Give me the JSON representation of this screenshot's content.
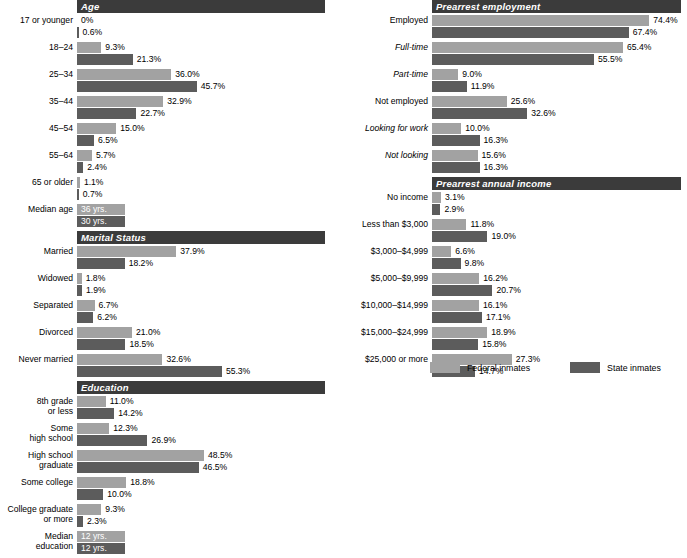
{
  "chart_data": {
    "type": "bar",
    "title": "",
    "orientation": "horizontal",
    "legend": {
      "position": "bottom-right",
      "entries": [
        {
          "name": "Federal inmates",
          "color": "#a2a2a2"
        },
        {
          "name": "State inmates",
          "color": "#5c5c5c"
        }
      ]
    },
    "series_names": [
      "Federal inmates",
      "State inmates"
    ],
    "axis": {
      "unit": "percent",
      "xlim": [
        0,
        80
      ],
      "grid": false,
      "tick_labels_shown": false
    },
    "value_labels": true,
    "sections": [
      {
        "id": "age",
        "title": "Age",
        "categories": [
          "17 or younger",
          "18–24",
          "25–34",
          "35–44",
          "45–54",
          "55–64",
          "65 or older",
          "Median age"
        ],
        "series": [
          {
            "name": "Federal inmates",
            "values": [
              0,
              9.3,
              36.0,
              32.9,
              15.0,
              5.7,
              1.1,
              36
            ]
          },
          {
            "name": "State inmates",
            "values": [
              0.6,
              21.3,
              45.7,
              22.7,
              6.5,
              2.4,
              0.7,
              30
            ]
          }
        ],
        "labels": [
          {
            "fed": "0%",
            "state": "0.6%"
          },
          {
            "fed": "9.3%",
            "state": "21.3%"
          },
          {
            "fed": "36.0%",
            "state": "45.7%"
          },
          {
            "fed": "32.9%",
            "state": "22.7%"
          },
          {
            "fed": "15.0%",
            "state": "6.5%"
          },
          {
            "fed": "5.7%",
            "state": "2.4%"
          },
          {
            "fed": "1.1%",
            "state": "0.7%"
          },
          {
            "fed": "36 yrs.",
            "state": "30 yrs."
          }
        ]
      },
      {
        "id": "marital-status",
        "title": "Marital Status",
        "categories": [
          "Married",
          "Widowed",
          "Separated",
          "Divorced",
          "Never married"
        ],
        "series": [
          {
            "name": "Federal inmates",
            "values": [
              37.9,
              1.8,
              6.7,
              21.0,
              32.6
            ]
          },
          {
            "name": "State inmates",
            "values": [
              18.2,
              1.9,
              6.2,
              18.5,
              55.3
            ]
          }
        ],
        "labels": [
          {
            "fed": "37.9%",
            "state": "18.2%"
          },
          {
            "fed": "1.8%",
            "state": "1.9%"
          },
          {
            "fed": "6.7%",
            "state": "6.2%"
          },
          {
            "fed": "21.0%",
            "state": "18.5%"
          },
          {
            "fed": "32.6%",
            "state": "55.3%"
          }
        ]
      },
      {
        "id": "education",
        "title": "Education",
        "categories": [
          "8th grade\nor less",
          "Some\nhigh school",
          "High school\ngraduate",
          "Some college",
          "College graduate\nor more",
          "Median\neducation"
        ],
        "series": [
          {
            "name": "Federal inmates",
            "values": [
              11.0,
              12.3,
              48.5,
              18.8,
              9.3,
              12
            ]
          },
          {
            "name": "State inmates",
            "values": [
              14.2,
              26.9,
              46.5,
              10.0,
              2.3,
              12
            ]
          }
        ],
        "labels": [
          {
            "fed": "11.0%",
            "state": "14.2%"
          },
          {
            "fed": "12.3%",
            "state": "26.9%"
          },
          {
            "fed": "48.5%",
            "state": "46.5%"
          },
          {
            "fed": "18.8%",
            "state": "10.0%"
          },
          {
            "fed": "9.3%",
            "state": "2.3%"
          },
          {
            "fed": "12 yrs.",
            "state": "12 yrs."
          }
        ]
      },
      {
        "id": "prearrest-employment",
        "title": "Prearrest employment",
        "categories": [
          "Employed",
          "Full-time",
          "Part-time",
          "Not employed",
          "Looking for work",
          "Not looking"
        ],
        "italic_categories": [
          "Full-time",
          "Part-time",
          "Looking for work",
          "Not looking"
        ],
        "series": [
          {
            "name": "Federal inmates",
            "values": [
              74.4,
              65.4,
              9.0,
              25.6,
              10.0,
              15.6
            ]
          },
          {
            "name": "State inmates",
            "values": [
              67.4,
              55.5,
              11.9,
              32.6,
              16.3,
              16.3
            ]
          }
        ],
        "labels": [
          {
            "fed": "74.4%",
            "state": "67.4%"
          },
          {
            "fed": "65.4%",
            "state": "55.5%"
          },
          {
            "fed": "9.0%",
            "state": "11.9%"
          },
          {
            "fed": "25.6%",
            "state": "32.6%"
          },
          {
            "fed": "10.0%",
            "state": "16.3%"
          },
          {
            "fed": "15.6%",
            "state": "16.3%"
          }
        ]
      },
      {
        "id": "prearrest-annual-income",
        "title": "Prearrest annual income",
        "categories": [
          "No income",
          "Less than $3,000",
          "$3,000–$4,999",
          "$5,000–$9,999",
          "$10,000–$14,999",
          "$15,000–$24,999",
          "$25,000 or more"
        ],
        "series": [
          {
            "name": "Federal inmates",
            "values": [
              3.1,
              11.8,
              6.6,
              16.2,
              16.1,
              18.9,
              27.3
            ]
          },
          {
            "name": "State inmates",
            "values": [
              2.9,
              19.0,
              9.8,
              20.7,
              17.1,
              15.8,
              14.7
            ]
          }
        ],
        "labels": [
          {
            "fed": "3.1%",
            "state": "2.9%"
          },
          {
            "fed": "11.8%",
            "state": "19.0%"
          },
          {
            "fed": "6.6%",
            "state": "9.8%"
          },
          {
            "fed": "16.2%",
            "state": "20.7%"
          },
          {
            "fed": "16.1%",
            "state": "17.1%"
          },
          {
            "fed": "18.9%",
            "state": "15.8%"
          },
          {
            "fed": "27.3%",
            "state": "14.7%"
          }
        ]
      }
    ]
  },
  "left_column": {
    "age": {
      "header": "Age",
      "rows": [
        {
          "label": "17 or younger",
          "fed_label": "0%",
          "state_label": "0.6%",
          "fed": 0,
          "state": 0.6
        },
        {
          "label": "18–24",
          "fed_label": "9.3%",
          "state_label": "21.3%",
          "fed": 9.3,
          "state": 21.3
        },
        {
          "label": "25–34",
          "fed_label": "36.0%",
          "state_label": "45.7%",
          "fed": 36.0,
          "state": 45.7
        },
        {
          "label": "35–44",
          "fed_label": "32.9%",
          "state_label": "22.7%",
          "fed": 32.9,
          "state": 22.7
        },
        {
          "label": "45–54",
          "fed_label": "15.0%",
          "state_label": "6.5%",
          "fed": 15.0,
          "state": 6.5
        },
        {
          "label": "55–64",
          "fed_label": "5.7%",
          "state_label": "2.4%",
          "fed": 5.7,
          "state": 2.4
        },
        {
          "label": "65 or older",
          "fed_label": "1.1%",
          "state_label": "0.7%",
          "fed": 1.1,
          "state": 0.7
        },
        {
          "label": "Median age",
          "fed_label": "36 yrs.",
          "state_label": "30 yrs.",
          "fed": 18.5,
          "state": 18.5,
          "inside": true
        }
      ]
    },
    "marital": {
      "header": "Marital Status",
      "rows": [
        {
          "label": "Married",
          "fed_label": "37.9%",
          "state_label": "18.2%",
          "fed": 37.9,
          "state": 18.2
        },
        {
          "label": "Widowed",
          "fed_label": "1.8%",
          "state_label": "1.9%",
          "fed": 1.8,
          "state": 1.9
        },
        {
          "label": "Separated",
          "fed_label": "6.7%",
          "state_label": "6.2%",
          "fed": 6.7,
          "state": 6.2
        },
        {
          "label": "Divorced",
          "fed_label": "21.0%",
          "state_label": "18.5%",
          "fed": 21.0,
          "state": 18.5
        },
        {
          "label": "Never married",
          "fed_label": "32.6%",
          "state_label": "55.3%",
          "fed": 32.6,
          "state": 55.3
        }
      ]
    },
    "education": {
      "header": "Education",
      "rows": [
        {
          "label": "8th grade\nor less",
          "fed_label": "11.0%",
          "state_label": "14.2%",
          "fed": 11.0,
          "state": 14.2
        },
        {
          "label": "Some\nhigh school",
          "fed_label": "12.3%",
          "state_label": "26.9%",
          "fed": 12.3,
          "state": 26.9
        },
        {
          "label": "High school\ngraduate",
          "fed_label": "48.5%",
          "state_label": "46.5%",
          "fed": 48.5,
          "state": 46.5
        },
        {
          "label": "Some college",
          "fed_label": "18.8%",
          "state_label": "10.0%",
          "fed": 18.8,
          "state": 10.0
        },
        {
          "label": "College graduate\nor more",
          "fed_label": "9.3%",
          "state_label": "2.3%",
          "fed": 9.3,
          "state": 2.3
        },
        {
          "label": "Median\neducation",
          "fed_label": "12 yrs.",
          "state_label": "12 yrs.",
          "fed": 18.5,
          "state": 18.5,
          "inside": true
        }
      ]
    }
  },
  "right_column": {
    "employment": {
      "header": "Prearrest employment",
      "rows": [
        {
          "label": "Employed",
          "fed_label": "74.4%",
          "state_label": "67.4%",
          "fed": 74.4,
          "state": 67.4,
          "italic": false
        },
        {
          "label": "Full-time",
          "fed_label": "65.4%",
          "state_label": "55.5%",
          "fed": 65.4,
          "state": 55.5,
          "italic": true
        },
        {
          "label": "Part-time",
          "fed_label": "9.0%",
          "state_label": "11.9%",
          "fed": 9.0,
          "state": 11.9,
          "italic": true
        },
        {
          "label": "Not employed",
          "fed_label": "25.6%",
          "state_label": "32.6%",
          "fed": 25.6,
          "state": 32.6,
          "italic": false
        },
        {
          "label": "Looking for work",
          "fed_label": "10.0%",
          "state_label": "16.3%",
          "fed": 10.0,
          "state": 16.3,
          "italic": true
        },
        {
          "label": "Not looking",
          "fed_label": "15.6%",
          "state_label": "16.3%",
          "fed": 15.6,
          "state": 16.3,
          "italic": true
        }
      ]
    },
    "income": {
      "header": "Prearrest annual income",
      "rows": [
        {
          "label": "No income",
          "fed_label": "3.1%",
          "state_label": "2.9%",
          "fed": 3.1,
          "state": 2.9
        },
        {
          "label": "Less than $3,000",
          "fed_label": "11.8%",
          "state_label": "19.0%",
          "fed": 11.8,
          "state": 19.0
        },
        {
          "label": "$3,000–$4,999",
          "fed_label": "6.6%",
          "state_label": "9.8%",
          "fed": 6.6,
          "state": 9.8
        },
        {
          "label": "$5,000–$9,999",
          "fed_label": "16.2%",
          "state_label": "20.7%",
          "fed": 16.2,
          "state": 20.7
        },
        {
          "label": "$10,000–$14,999",
          "fed_label": "16.1%",
          "state_label": "17.1%",
          "fed": 16.1,
          "state": 17.1
        },
        {
          "label": "$15,000–$24,999",
          "fed_label": "18.9%",
          "state_label": "15.8%",
          "fed": 18.9,
          "state": 15.8
        },
        {
          "label": "$25,000 or more",
          "fed_label": "27.3%",
          "state_label": "14.7%",
          "fed": 27.3,
          "state": 14.7
        }
      ]
    }
  },
  "legend": {
    "federal": "Federal inmates",
    "state": "State inmates"
  },
  "colors": {
    "federal": "#a2a2a2",
    "state": "#5c5c5c",
    "header_bar": "#3b3b3b",
    "background": "#ffffff"
  }
}
